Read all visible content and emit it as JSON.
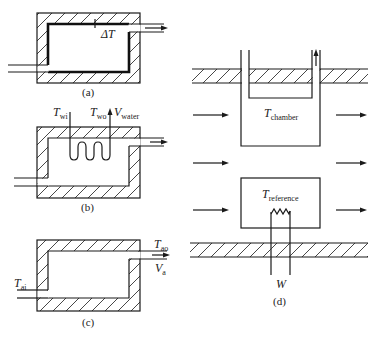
{
  "figure": {
    "panels": {
      "a": {
        "caption": "(a)",
        "delta_label": "ΔT"
      },
      "b": {
        "caption": "(b)",
        "t_inlet": {
          "main": "T",
          "sub": "wi"
        },
        "t_outlet": {
          "main": "T",
          "sub": "wo"
        },
        "v_water": {
          "main": "V",
          "sub": "water"
        }
      },
      "c": {
        "caption": "(c)",
        "t_air_in": {
          "main": "T",
          "sub": "ai"
        },
        "t_air_out": {
          "main": "T",
          "sub": "ao"
        },
        "v_air": {
          "main": "V",
          "sub": "a"
        }
      },
      "d": {
        "caption": "(d)",
        "t_chamber": {
          "main": "T",
          "sub": "chamber"
        },
        "t_reference": {
          "main": "T",
          "sub": "reference"
        },
        "power_label": "W"
      }
    }
  }
}
